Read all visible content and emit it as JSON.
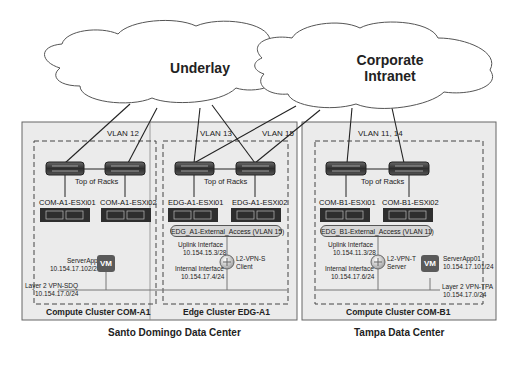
{
  "clouds": {
    "underlay": {
      "label": "Underlay"
    },
    "corporate": {
      "label_line1": "Corporate",
      "label_line2": "Intranet"
    }
  },
  "data_centers": [
    {
      "name": "Santo Domingo Data Center",
      "clusters": [
        {
          "name": "Compute Cluster COM-A1",
          "vlan": "VLAN 12",
          "tor_label": "Top of Racks",
          "hosts": [
            "COM-A1-ESXi01",
            "COM-A1-ESXi02"
          ],
          "vm": {
            "badge": "VM",
            "name": "ServerApp02",
            "ip": "10.154.17.102/24"
          },
          "segment": {
            "name": "Layer 2 VPN-SDQ",
            "subnet": "10.154.17.0/24"
          }
        },
        {
          "name": "Edge Cluster EDG-A1",
          "vlans": [
            "VLAN 13",
            "VLAN 15"
          ],
          "tor_label": "Top of Racks",
          "hosts": [
            "EDG-A1-ESXi01",
            "EDG-A1-ESXi02"
          ],
          "portgroup": "EDG_A1-External_Access (VLAN 15)",
          "uplink": {
            "label": "Uplink Interface",
            "ip": "10.154.15.3/28"
          },
          "internal": {
            "label": "Internal Interface",
            "ip": "10.154.17.4/24"
          },
          "router": {
            "line1": "L2-VPN-S",
            "line2": "Client"
          }
        }
      ]
    },
    {
      "name": "Tampa Data Center",
      "clusters": [
        {
          "name": "Compute Cluster COM-B1",
          "vlan": "VLAN 11, 14",
          "tor_label": "Top of Racks",
          "hosts": [
            "COM-B1-ESXi01",
            "COM-B1-ESXi02"
          ],
          "portgroup": "EDG_B1-External_Access (VLAN 11)",
          "uplink": {
            "label": "Uplink Interface",
            "ip": "10.154.11.3/28"
          },
          "internal": {
            "label": "Internal Interface",
            "ip": "10.154.17.6/24"
          },
          "router": {
            "line1": "L2-VPN-T",
            "line2": "Server"
          },
          "vm": {
            "badge": "VM",
            "name": "ServerApp01",
            "ip": "10.154.17.101/24"
          },
          "segment": {
            "name": "Layer 2 VPN-TPA",
            "subnet": "10.154.17.0/24"
          }
        }
      ]
    }
  ],
  "colors": {
    "dc_fill": "#ebebeb",
    "switch": "#3c3c3c",
    "server": "#2e2e2e",
    "vm": "#5a5a5a",
    "pill": "#d6d6d6"
  }
}
